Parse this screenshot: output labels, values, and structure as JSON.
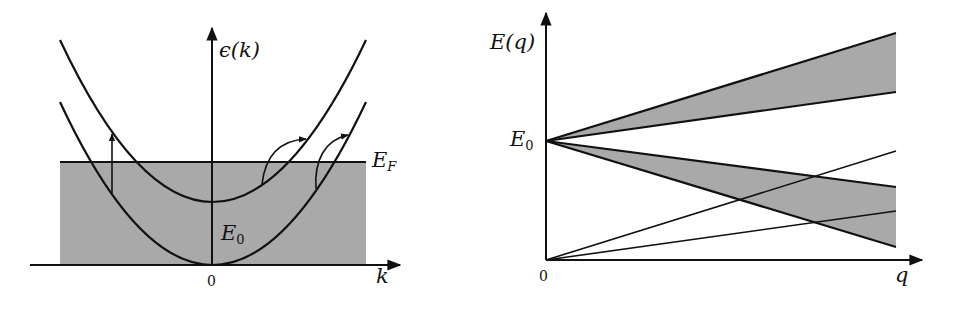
{
  "left_panel": {
    "y_axis_label": "ϵ(k)",
    "x_axis_label": "k",
    "origin_label": "0",
    "fermi_label": {
      "base": "E",
      "sub": "F"
    },
    "gap_label": {
      "base": "E",
      "sub": "0"
    },
    "description": "Two parabolic bands separated by E0; filled states below Fermi level EF; vertical and intra/inter-band excitation arrows"
  },
  "right_panel": {
    "y_axis_label": "E(q)",
    "x_axis_label": "q",
    "origin_label": "0",
    "e0_label": {
      "base": "E",
      "sub": "0"
    },
    "description": "Particle-hole continua: two shaded wedges emanating from E0 and two straight lines from origin"
  },
  "colors": {
    "fill": "#a9a9a9",
    "line": "#111111",
    "background": "#ffffff"
  }
}
